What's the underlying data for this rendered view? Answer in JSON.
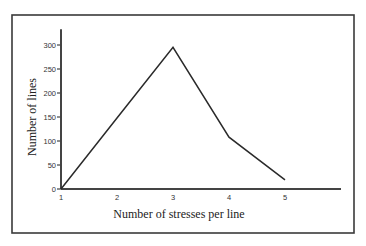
{
  "chart_data": {
    "type": "line",
    "title": "",
    "xlabel": "Number of stresses per line",
    "ylabel": "Number of lines",
    "x": [
      1,
      2,
      3,
      4,
      5
    ],
    "series": [
      {
        "name": "Number of lines",
        "values": [
          0,
          148,
          295,
          108,
          19
        ]
      }
    ],
    "xticks": [
      "1",
      "2",
      "3",
      "4",
      "5"
    ],
    "yticks": [
      "0",
      "50",
      "100",
      "150",
      "200",
      "250",
      "300"
    ],
    "xlim": [
      1,
      6
    ],
    "ylim": [
      0,
      333
    ],
    "grid": false,
    "legend": "none"
  }
}
